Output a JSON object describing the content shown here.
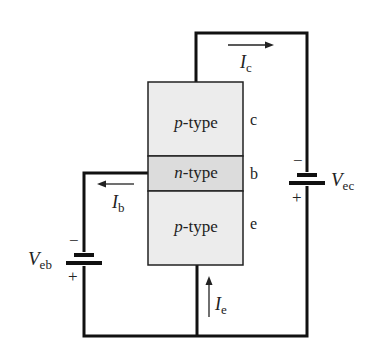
{
  "diagram": {
    "regions": [
      {
        "id": "collector",
        "label_italic": "p",
        "label_rest": "-type",
        "terminal": "c"
      },
      {
        "id": "base",
        "label_italic": "n",
        "label_rest": "-type",
        "terminal": "b"
      },
      {
        "id": "emitter",
        "label_italic": "p",
        "label_rest": "-type",
        "terminal": "e"
      }
    ],
    "currents": {
      "collector": {
        "symbol": "I",
        "sub": "c"
      },
      "base": {
        "symbol": "I",
        "sub": "b"
      },
      "emitter": {
        "symbol": "I",
        "sub": "e"
      }
    },
    "batteries": {
      "ec": {
        "symbol": "V",
        "sub": "ec",
        "minus": "−",
        "plus": "+"
      },
      "eb": {
        "symbol": "V",
        "sub": "eb",
        "minus": "−",
        "plus": "+"
      }
    },
    "colors": {
      "p_region": "#ececec",
      "n_region": "#dcdcdc",
      "wire": "#111111"
    }
  }
}
